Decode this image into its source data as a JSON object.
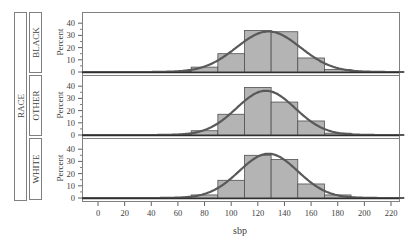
{
  "chart_data": {
    "type": "bar",
    "subtype": "paneled histogram with normal density overlay",
    "title": "",
    "xlabel": "sbp",
    "ylabel": "Percent",
    "row_variable": "RACE",
    "x_ticks": [
      0,
      20,
      40,
      60,
      80,
      100,
      120,
      140,
      160,
      180,
      200,
      220
    ],
    "xlim": [
      -12,
      230
    ],
    "y_ticks": [
      0,
      10,
      20,
      30,
      40
    ],
    "ylim": [
      0,
      50
    ],
    "bin_width": 20,
    "bin_edges": [
      50,
      70,
      90,
      110,
      130,
      150,
      170,
      190,
      210
    ],
    "categories": [
      "50-70",
      "70-90",
      "90-110",
      "110-130",
      "130-150",
      "150-170",
      "170-190",
      "190-210"
    ],
    "series": [
      {
        "name": "BLACK",
        "values": [
          0.5,
          4,
          15,
          34,
          33,
          11.5,
          2,
          0.5
        ],
        "normal_mean": 128,
        "normal_sd": 24
      },
      {
        "name": "OTHER",
        "values": [
          0.5,
          3.5,
          17,
          39,
          27,
          11.5,
          1.5,
          0.5
        ],
        "normal_mean": 126,
        "normal_sd": 22
      },
      {
        "name": "WHITE",
        "values": [
          0.5,
          2.5,
          14.5,
          35,
          31.5,
          11.5,
          2.5,
          0.5
        ],
        "normal_mean": 128,
        "normal_sd": 22
      }
    ],
    "grid": false,
    "legend": "none",
    "colors": {
      "bar_fill": "#b4b4b4",
      "bar_edge": "#505050",
      "curve": "#595959",
      "frame": "#808080"
    }
  },
  "labels": {
    "row_header": "RACE",
    "rows": [
      "BLACK",
      "OTHER",
      "WHITE"
    ],
    "ylabel": "Percent",
    "xlabel": "sbp"
  }
}
